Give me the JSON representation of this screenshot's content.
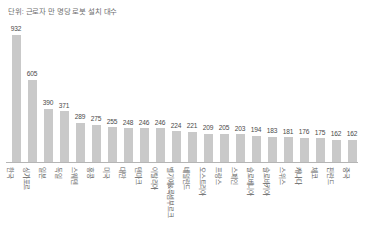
{
  "chart_data": {
    "type": "bar",
    "title": "단위: 근로자 만 명당 로봇 설치 대수",
    "xlabel": "",
    "ylabel": "",
    "ylim": [
      0,
      932
    ],
    "grid": false,
    "legend": false,
    "bar_color": "#c9c9c9",
    "axis_color": "#b5b5b5",
    "categories": [
      "한국",
      "싱가포르",
      "일본",
      "독일",
      "스웨덴",
      "홍콩",
      "미국",
      "대만",
      "덴마크",
      "이탈리아",
      "벨기에&룩셈부르크",
      "네덜란드",
      "오스트리아",
      "프랑스",
      "스페인",
      "슬로베니아",
      "슬로바키아",
      "스위스",
      "캐나다",
      "체코",
      "핀란드",
      "중국"
    ],
    "values": [
      932,
      605,
      390,
      371,
      289,
      275,
      255,
      248,
      246,
      246,
      224,
      221,
      209,
      205,
      203,
      194,
      183,
      181,
      176,
      175,
      162,
      162
    ],
    "value_labels": [
      "932",
      "605",
      "390",
      "371",
      "289",
      "275",
      "255",
      "248",
      "246",
      "246",
      "224",
      "221",
      "209",
      "205",
      "203",
      "194",
      "183",
      "181",
      "176",
      "175",
      "162",
      "162"
    ]
  }
}
